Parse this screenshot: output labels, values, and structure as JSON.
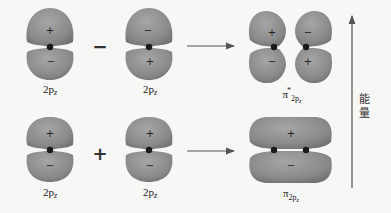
{
  "diagram": {
    "title": "",
    "colors": {
      "lobe_fill": "#8c8c8c",
      "lobe_highlight": "#a3a3a3",
      "lobe_shadow": "#6f6f6f",
      "nucleus": "#1a1a1a",
      "arrow": "#555555",
      "background": "#f7f7f5"
    },
    "rows": [
      {
        "name": "antibonding",
        "combination_operator": "−",
        "left_orbital": {
          "label_main": "2p",
          "label_sub": "z",
          "top_sign": "+",
          "bottom_sign": "−"
        },
        "right_orbital": {
          "label_main": "2p",
          "label_sub": "z",
          "top_sign": "−",
          "bottom_sign": "+"
        },
        "result": {
          "label_main": "π",
          "label_sup": "*",
          "label_sub_main": "2p",
          "label_sub_sub": "z",
          "signs": {
            "top_left": "+",
            "top_right": "−",
            "bottom_left": "−",
            "bottom_right": "+"
          }
        }
      },
      {
        "name": "bonding",
        "combination_operator": "+",
        "left_orbital": {
          "label_main": "2p",
          "label_sub": "z",
          "top_sign": "+",
          "bottom_sign": "−"
        },
        "right_orbital": {
          "label_main": "2p",
          "label_sub": "z",
          "top_sign": "+",
          "bottom_sign": "−"
        },
        "result": {
          "label_main": "π",
          "label_sub_main": "2p",
          "label_sub_sub": "z",
          "signs": {
            "top": "+",
            "bottom": "−"
          }
        }
      }
    ],
    "energy_axis": {
      "label_line1": "能",
      "label_line2": "量",
      "direction": "up"
    }
  }
}
